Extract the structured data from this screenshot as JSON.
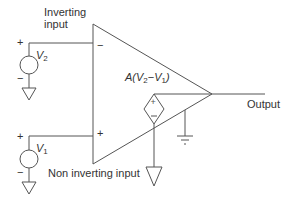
{
  "diagram": {
    "labels": {
      "inverting_input_line1": "Inverting",
      "inverting_input_line2": "input",
      "non_inverting_input": "Non inverting input",
      "output": "Output",
      "gain_expr_prefix": "A(",
      "gain_v2": "V",
      "gain_v2_sub": "2",
      "gain_minus": "−",
      "gain_v1": "V",
      "gain_v1_sub": "1",
      "gain_close": ")",
      "v2_name": "V",
      "v2_sub": "2",
      "v1_name": "V",
      "v1_sub": "1",
      "inv_pin": "−",
      "noninv_pin": "+",
      "src_plus": "+",
      "src_minus": "−"
    },
    "colors": {
      "stroke": "#555555",
      "text": "#333333",
      "background": "#ffffff"
    }
  }
}
